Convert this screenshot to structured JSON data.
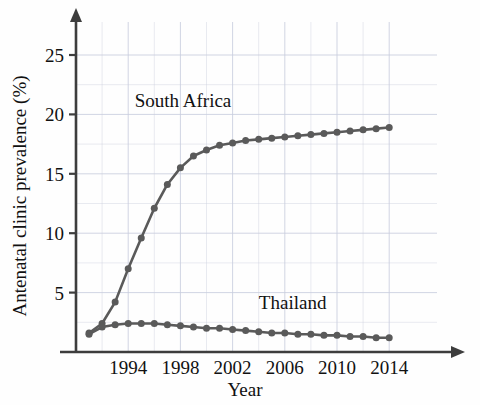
{
  "chart_data": {
    "type": "line",
    "title": "",
    "xlabel": "Year",
    "ylabel": "Antenatal clinic prevalence (%)",
    "xlim": [
      1990,
      2015
    ],
    "ylim": [
      0,
      27
    ],
    "xticks": [
      "1994",
      "1998",
      "2002",
      "2006",
      "2010",
      "2014"
    ],
    "xtick_values": [
      1994,
      1998,
      2002,
      2006,
      2010,
      2014
    ],
    "yticks": [
      "5",
      "10",
      "15",
      "20",
      "25"
    ],
    "ytick_values": [
      5,
      10,
      15,
      20,
      25
    ],
    "grid": "both, light dotted, minor every 2.5 on y and every 2 on x",
    "grid_y_step": 2.5,
    "grid_x_step": 2,
    "legend_position": "inline annotations next to curves",
    "marker": "filled circle",
    "series": [
      {
        "name": "South Africa",
        "color": "#5a5a5a",
        "label_x": 1998.2,
        "label_y": 20.6,
        "x": [
          1991,
          1992,
          1993,
          1994,
          1995,
          1996,
          1997,
          1998,
          1999,
          2000,
          2001,
          2002,
          2003,
          2004,
          2005,
          2006,
          2007,
          2008,
          2009,
          2010,
          2011,
          2012,
          2013,
          2014
        ],
        "values": [
          1.6,
          2.4,
          4.2,
          7.0,
          9.6,
          12.1,
          14.1,
          15.5,
          16.5,
          17.0,
          17.4,
          17.6,
          17.8,
          17.9,
          18.0,
          18.1,
          18.2,
          18.3,
          18.4,
          18.5,
          18.6,
          18.7,
          18.8,
          18.9
        ]
      },
      {
        "name": "Thailand",
        "color": "#5a5a5a",
        "label_x": 2006.6,
        "label_y": 3.6,
        "x": [
          1991,
          1992,
          1993,
          1994,
          1995,
          1996,
          1997,
          1998,
          1999,
          2000,
          2001,
          2002,
          2003,
          2004,
          2005,
          2006,
          2007,
          2008,
          2009,
          2010,
          2011,
          2012,
          2013,
          2014
        ],
        "values": [
          1.5,
          2.1,
          2.3,
          2.4,
          2.4,
          2.4,
          2.3,
          2.2,
          2.1,
          2.0,
          2.0,
          1.9,
          1.8,
          1.7,
          1.6,
          1.6,
          1.5,
          1.5,
          1.4,
          1.4,
          1.3,
          1.3,
          1.2,
          1.2
        ]
      }
    ]
  },
  "axes": {
    "y_axis_label": "Antenatal clinic prevalence (%)",
    "x_axis_label": "Year",
    "axis_color": "#3d3d3d",
    "grid_color": "#c9cede"
  }
}
